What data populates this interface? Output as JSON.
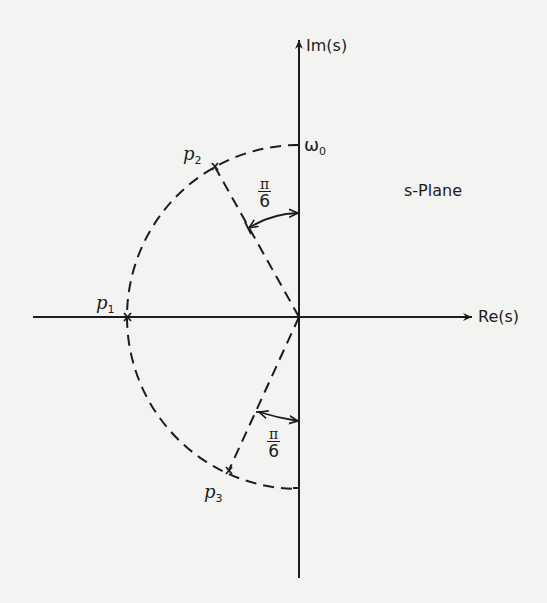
{
  "diagram": {
    "title": "s-Plane",
    "axes": {
      "imag_label": "Im(s)",
      "real_label": "Re(s)"
    },
    "circle_label": "ω",
    "circle_label_sub": "0",
    "poles": [
      {
        "name": "p",
        "sub": "1",
        "marker": "x"
      },
      {
        "name": "p",
        "sub": "2",
        "marker": "x"
      },
      {
        "name": "p",
        "sub": "3",
        "marker": "x"
      }
    ],
    "angles": [
      {
        "num": "π",
        "den": "6"
      },
      {
        "num": "π",
        "den": "6"
      }
    ],
    "colors": {
      "ink": "#1c1c1c",
      "paper": "#f3f3f1"
    }
  }
}
